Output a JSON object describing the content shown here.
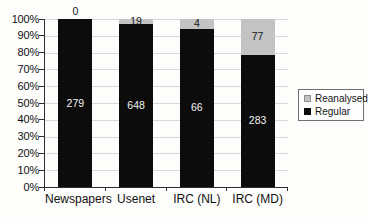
{
  "chart_data": {
    "type": "bar",
    "subtype": "stacked-100-percent-column",
    "title": "",
    "xlabel": "",
    "ylabel": "",
    "categories": [
      "Newspapers",
      "Usenet",
      "IRC (NL)",
      "IRC (MD)"
    ],
    "series": [
      {
        "name": "Reanalysed",
        "color": "#c3c3c3",
        "values": [
          0,
          19,
          4,
          77
        ]
      },
      {
        "name": "Regular",
        "color": "#0c0c0c",
        "values": [
          279,
          648,
          66,
          283
        ]
      }
    ],
    "totals": [
      279,
      667,
      70,
      360
    ],
    "y_axis": {
      "min": 0,
      "max": 100,
      "ticks": [
        "0%",
        "10%",
        "20%",
        "30%",
        "40%",
        "50%",
        "60%",
        "70%",
        "80%",
        "90%",
        "100%"
      ]
    },
    "grid": true,
    "legend": {
      "position": "right",
      "entries": [
        "Reanalysed",
        "Regular"
      ]
    },
    "colors": {
      "grid": "#d9d9d9",
      "axis": "#2e2e2e",
      "label_dark": "#151515",
      "label_light": "#f2f2f2",
      "background": "#fdfdfc"
    }
  }
}
